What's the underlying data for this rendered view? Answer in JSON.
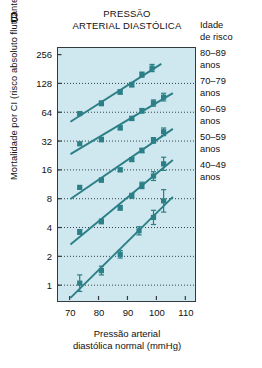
{
  "panel": {
    "label": "B"
  },
  "title": {
    "line1": "PRESSÃO",
    "line2": "ARTERIAL DIASTÓLICA"
  },
  "axes": {
    "ylabel": "Mortalidade por CI (risco absoluto flutuante e IC de 95%)",
    "xlabel_line1": "Pressão arterial",
    "xlabel_line2": "diastólica normal (mmHg)"
  },
  "legend": {
    "title_line1": "Idade",
    "title_line2": "de risco",
    "items": [
      {
        "range": "80–89",
        "unit": "anos"
      },
      {
        "range": "70–79",
        "unit": "anos"
      },
      {
        "range": "60–69",
        "unit": "anos"
      },
      {
        "range": "50–59",
        "unit": "anos"
      },
      {
        "range": "40–49",
        "unit": "anos"
      }
    ]
  },
  "colors": {
    "series": "#2b7f87",
    "plot_background": "#cfe7ee",
    "frame": "#333a3d",
    "gridline": "#2f4448"
  },
  "chart_data": {
    "type": "scatter",
    "title": "PRESSÃO ARTERIAL DIASTÓLICA",
    "xlabel": "Pressão arterial diastólica normal (mmHg)",
    "ylabel": "Mortalidade por CI (risco absoluto flutuante e IC de 95%)",
    "yscale": "log2",
    "ylim": [
      0.7,
      300
    ],
    "xlim": [
      66,
      113
    ],
    "yticks": [
      1,
      2,
      4,
      8,
      16,
      32,
      64,
      128,
      256
    ],
    "xticks": [
      70,
      80,
      90,
      100,
      110
    ],
    "grid": "horizontal-dotted",
    "legend_position": "right",
    "legend_title": "Idade de risco",
    "series": [
      {
        "name": "80–89 anos",
        "points": [
          {
            "x": 73.5,
            "y": 62,
            "lo": 62,
            "hi": 62
          },
          {
            "x": 81,
            "y": 79,
            "lo": 75,
            "hi": 84
          },
          {
            "x": 87.5,
            "y": 104,
            "lo": 99,
            "hi": 110
          },
          {
            "x": 91.5,
            "y": 124,
            "lo": 118,
            "hi": 131
          },
          {
            "x": 95,
            "y": 158,
            "lo": 149,
            "hi": 168
          },
          {
            "x": 98.5,
            "y": 185,
            "lo": 170,
            "hi": 202
          }
        ]
      },
      {
        "name": "70–79 anos",
        "points": [
          {
            "x": 73.5,
            "y": 30,
            "lo": 30,
            "hi": 30
          },
          {
            "x": 81,
            "y": 33,
            "lo": 32,
            "hi": 35
          },
          {
            "x": 87.5,
            "y": 44,
            "lo": 42,
            "hi": 46
          },
          {
            "x": 91.5,
            "y": 55,
            "lo": 53,
            "hi": 58
          },
          {
            "x": 95,
            "y": 66,
            "lo": 63,
            "hi": 70
          },
          {
            "x": 99,
            "y": 80,
            "lo": 74,
            "hi": 86
          },
          {
            "x": 102.5,
            "y": 92,
            "lo": 84,
            "hi": 101
          }
        ]
      },
      {
        "name": "60–69 anos",
        "points": [
          {
            "x": 73.5,
            "y": 10.5,
            "lo": 10.5,
            "hi": 10.5
          },
          {
            "x": 81,
            "y": 12.5,
            "lo": 12.0,
            "hi": 13.1
          },
          {
            "x": 87.5,
            "y": 16.0,
            "lo": 15.4,
            "hi": 16.7
          },
          {
            "x": 91.5,
            "y": 20.5,
            "lo": 19.6,
            "hi": 21.5
          },
          {
            "x": 95,
            "y": 25.5,
            "lo": 24.2,
            "hi": 26.9
          },
          {
            "x": 99,
            "y": 32.5,
            "lo": 30.4,
            "hi": 34.8
          },
          {
            "x": 102.5,
            "y": 40.0,
            "lo": 36.5,
            "hi": 43.8
          }
        ]
      },
      {
        "name": "50–59 anos",
        "points": [
          {
            "x": 73.5,
            "y": 3.6,
            "lo": 3.4,
            "hi": 3.8
          },
          {
            "x": 81,
            "y": 4.6,
            "lo": 4.4,
            "hi": 4.9
          },
          {
            "x": 87.5,
            "y": 6.4,
            "lo": 6.1,
            "hi": 6.8
          },
          {
            "x": 91.5,
            "y": 8.6,
            "lo": 8.1,
            "hi": 9.1
          },
          {
            "x": 95,
            "y": 11.0,
            "lo": 10.2,
            "hi": 11.9
          },
          {
            "x": 99,
            "y": 13.8,
            "lo": 12.4,
            "hi": 15.3
          },
          {
            "x": 102.5,
            "y": 18.5,
            "lo": 15.8,
            "hi": 21.7
          }
        ]
      },
      {
        "name": "40–49 anos",
        "points": [
          {
            "x": 73.5,
            "y": 1.05,
            "lo": 0.86,
            "hi": 1.28
          },
          {
            "x": 81,
            "y": 1.42,
            "lo": 1.28,
            "hi": 1.58
          },
          {
            "x": 87.5,
            "y": 2.1,
            "lo": 1.92,
            "hi": 2.3
          },
          {
            "x": 94,
            "y": 3.7,
            "lo": 3.35,
            "hi": 4.08
          },
          {
            "x": 99,
            "y": 5.1,
            "lo": 4.3,
            "hi": 6.05
          },
          {
            "x": 102.5,
            "y": 7.6,
            "lo": 5.8,
            "hi": 9.95
          }
        ]
      }
    ]
  }
}
